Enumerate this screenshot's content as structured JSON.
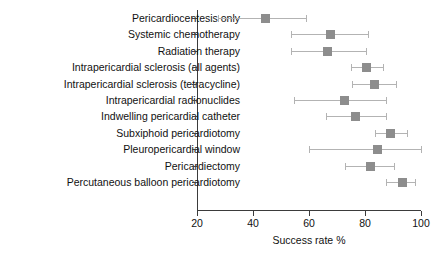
{
  "chart_data": {
    "type": "scatter",
    "title": "",
    "xlabel": "Success rate %",
    "ylabel": "",
    "xlim": [
      20,
      100
    ],
    "xticks": [
      20,
      40,
      60,
      80,
      100
    ],
    "grid": false,
    "legend": null,
    "orientation": "horizontal",
    "marker_color": "#8d8d8d",
    "error_color": "#b3b3b3",
    "axis_color": "#3b3b3b",
    "categories": [
      "Pericardiocentesis only",
      "Systemic chemotherapy",
      "Radiation therapy",
      "Intrapericardial sclerosis (all agents)",
      "Intrapericardial sclerosis (tetracycline)",
      "Intrapericardial radionuclides",
      "Indwelling pericardial catheter",
      "Subxiphoid pericardiotomy",
      "Pleuropericardial window",
      "Pericardiectomy",
      "Percutaneous balloon pericardiotomy"
    ],
    "points": [
      {
        "label": "Pericardiocentesis only",
        "value": 44.5,
        "low": 27.5,
        "high": 59.0
      },
      {
        "label": "Systemic chemotherapy",
        "value": 67.5,
        "low": 53.5,
        "high": 81.0
      },
      {
        "label": "Radiation therapy",
        "value": 66.5,
        "low": 53.5,
        "high": 80.5
      },
      {
        "label": "Intrapericardial sclerosis (all agents)",
        "value": 80.5,
        "low": 75.0,
        "high": 86.5
      },
      {
        "label": "Intrapericardial sclerosis (tetracycline)",
        "value": 83.5,
        "low": 75.5,
        "high": 91.0
      },
      {
        "label": "Intrapericardial radionuclides",
        "value": 72.5,
        "low": 54.5,
        "high": 87.5
      },
      {
        "label": "Indwelling pericardial catheter",
        "value": 76.5,
        "low": 66.0,
        "high": 87.5
      },
      {
        "label": "Subxiphoid pericardiotomy",
        "value": 89.0,
        "low": 83.5,
        "high": 95.0
      },
      {
        "label": "Pleuropericardial window",
        "value": 84.5,
        "low": 60.0,
        "high": 100.0
      },
      {
        "label": "Pericardiectomy",
        "value": 82.0,
        "low": 73.0,
        "high": 90.5
      },
      {
        "label": "Percutaneous balloon pericardiotomy",
        "value": 93.5,
        "low": 87.5,
        "high": 98.0
      }
    ]
  }
}
